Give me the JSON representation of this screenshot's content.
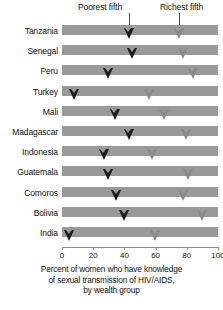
{
  "chart_data": {
    "type": "scatter",
    "title": "",
    "xlabel": "Percent of women who have knowledge of sexual transmission of HIV/AIDS, by wealth group",
    "ylabel": "",
    "xlim": [
      0,
      100
    ],
    "grid": true,
    "legend_position": "top",
    "categories": [
      "Tanzania",
      "Senegal",
      "Peru",
      "Turkey",
      "Mali",
      "Madagascar",
      "Indonesia",
      "Guatemala",
      "Comoros",
      "Bolivia",
      "India"
    ],
    "series": [
      {
        "name": "Poorest fifth",
        "color": "#1c1c1c",
        "values": [
          43,
          45,
          30,
          8,
          34,
          43,
          27,
          30,
          35,
          40,
          5
        ]
      },
      {
        "name": "Richest fifth",
        "color": "#8a8a8a",
        "values": [
          75,
          78,
          84,
          56,
          66,
          80,
          58,
          81,
          78,
          90,
          60
        ]
      }
    ],
    "xticks": [
      0,
      20,
      40,
      60,
      80,
      100
    ],
    "xticklabels": [
      "0",
      "20",
      "40",
      "60",
      "80",
      "100"
    ],
    "gridlines": [
      20,
      40,
      60,
      80
    ]
  },
  "annotations": {
    "poorest_label": "Poorest fifth",
    "richest_label": "Richest fifth"
  },
  "caption": {
    "line1": "Percent of women who have knowledge",
    "line2": "of sexual transmission of HIV/AIDS,",
    "line3": "by wealth group"
  },
  "colors": {
    "band_dark": "#999999",
    "band_light": "#e8e8e8",
    "poorest_marker": "#1c1c1c",
    "richest_marker": "#8a8a8a",
    "axis": "#8d8d8d",
    "text": "#111111",
    "background": "#ffffff"
  }
}
